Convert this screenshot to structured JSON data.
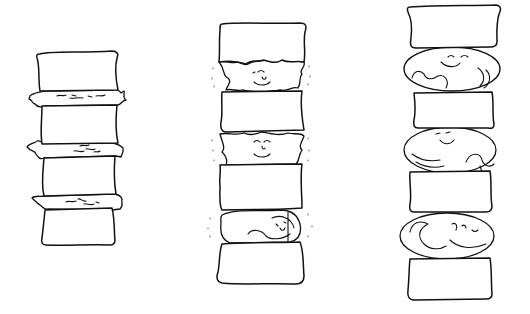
{
  "illustration": {
    "description": "Hand-drawn line illustration of three spinal columns comparing intervertebral disc states",
    "line_color": "#111111",
    "background": "#ffffff",
    "spines": [
      {
        "id": "left",
        "label": "degenerated discs",
        "vertebrae_count": 4,
        "discs": [
          {
            "state": "thin, frayed edges, squiggle marks"
          },
          {
            "state": "thin, frayed edges, squiggle marks"
          },
          {
            "state": "thin, frayed edges, squiggle marks"
          }
        ]
      },
      {
        "id": "middle",
        "label": "moderate discs with faces",
        "vertebrae_count": 4,
        "discs": [
          {
            "state": "irregular disc with smiling face, motion dots"
          },
          {
            "state": "irregular disc with smiling face, motion dots"
          },
          {
            "state": "curled sleeping figure, motion dots"
          }
        ]
      },
      {
        "id": "right",
        "label": "healthy plump discs",
        "vertebrae_count": 4,
        "discs": [
          {
            "state": "round plump disc, smiling face, curled figure"
          },
          {
            "state": "round plump disc, smiling face, curled figure"
          },
          {
            "state": "round plump disc, smiling face, curled figure"
          }
        ]
      }
    ]
  }
}
